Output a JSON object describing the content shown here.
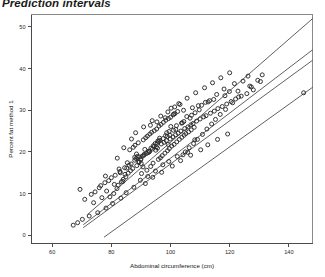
{
  "chart_data": {
    "type": "scatter",
    "title": "Prediction intervals",
    "xlabel": "Abdominal circumference (cm)",
    "ylabel": "Percent fat method 1",
    "xlim": [
      53,
      148
    ],
    "ylim": [
      -2,
      53
    ],
    "xticks": [
      60,
      80,
      100,
      120,
      140
    ],
    "yticks": [
      0,
      10,
      20,
      30,
      40,
      50
    ],
    "grid": false,
    "legend": null,
    "marker": "open-circle",
    "series": [
      {
        "name": "observations",
        "x": [
          69.4,
          78.0,
          86.0,
          88.5,
          82.9,
          83.9,
          88.3,
          95.5,
          104.5,
          98.7,
          99.2,
          101.8,
          89.4,
          95.6,
          98.9,
          100.1,
          91.0,
          90.7,
          94.4,
          89.9,
          99.8,
          96.4,
          105.5,
          103.7,
          97.5,
          95.0,
          92.4,
          90.1,
          84.6,
          85.2,
          88.8,
          92.6,
          96.0,
          99.5,
          102.0,
          106.6,
          108.3,
          110.5,
          112.7,
          115.6,
          118.1,
          121.6,
          126.2,
          124.5,
          119.9,
          113.2,
          109.7,
          107.1,
          104.0,
          101.0,
          98.3,
          94.8,
          91.3,
          87.9,
          85.4,
          82.6,
          80.0,
          77.8,
          75.9,
          73.2,
          71.0,
          74.5,
          76.4,
          79.1,
          81.3,
          83.0,
          84.5,
          86.7,
          87.9,
          89.6,
          91.1,
          92.8,
          93.9,
          95.2,
          96.9,
          97.8,
          98.6,
          99.9,
          100.8,
          101.7,
          102.6,
          103.5,
          104.8,
          105.9,
          106.9,
          107.6,
          108.8,
          110.0,
          111.2,
          112.0,
          113.5,
          114.8,
          116.0,
          117.5,
          119.0,
          120.5,
          122.0,
          123.9,
          125.8,
          128.0,
          90.2,
          92.0,
          93.3,
          94.1,
          95.9,
          96.6,
          97.2,
          98.1,
          99.0,
          99.6,
          100.4,
          101.2,
          102.1,
          103.0,
          103.8,
          104.6,
          105.2,
          106.1,
          107.0,
          108.0,
          86.2,
          87.4,
          88.0,
          89.1,
          90.8,
          91.6,
          92.2,
          93.0,
          93.6,
          94.5,
          95.3,
          96.1,
          96.8,
          97.6,
          98.4,
          99.3,
          100.0,
          100.9,
          101.5,
          102.4,
          79.5,
          80.8,
          81.9,
          82.3,
          83.4,
          84.0,
          84.9,
          85.7,
          86.5,
          87.2,
          88.6,
          89.3,
          90.0,
          90.5,
          91.8,
          92.9,
          93.4,
          94.2,
          95.7,
          96.3,
          104.2,
          105.0,
          106.3,
          107.8,
          109.1,
          110.8,
          112.3,
          113.9,
          115.2,
          116.8,
          118.6,
          121.0,
          123.0,
          127.3,
          129.5,
          131.0,
          74.0,
          76.8,
          78.4,
          81.0,
          100.2,
          102.8,
          105.6,
          108.5,
          111.5,
          114.2,
          117.0,
          120.0,
          88.2,
          90.9,
          93.8,
          96.7,
          99.1,
          101.4,
          103.2,
          86.8,
          84.2,
          82.0,
          145.0,
          108.2,
          91.5,
          94.0,
          97.0,
          100.6,
          103.4,
          106.8,
          110.2,
          112.6,
          115.9,
          119.3,
          87.6,
          85.0,
          83.2,
          80.4,
          78.2,
          75.4,
          72.5,
          70.2,
          68.6,
          67.1,
          93.2,
          95.4,
          98.2,
          101.1,
          104.4,
          107.4,
          109.4,
          111.8,
          114.6,
          118.4,
          122.8,
          126.8,
          130.4,
          89.8,
          92.3,
          94.9,
          97.4,
          99.4,
          102.3,
          105.8
        ],
        "y": [
          11.0,
          14.2,
          16.8,
          19.5,
          15.3,
          12.9,
          18.4,
          22.1,
          27.3,
          24.6,
          21.8,
          25.4,
          17.6,
          20.9,
          23.7,
          26.1,
          19.2,
          16.4,
          21.3,
          18.1,
          24.0,
          22.8,
          28.5,
          26.9,
          23.2,
          20.4,
          19.8,
          17.2,
          14.6,
          16.1,
          18.9,
          20.2,
          22.5,
          24.9,
          26.3,
          28.1,
          29.4,
          31.2,
          32.0,
          33.8,
          35.1,
          36.4,
          38.2,
          37.0,
          34.5,
          32.3,
          30.1,
          28.8,
          27.0,
          25.2,
          23.9,
          22.0,
          20.6,
          18.7,
          17.4,
          15.9,
          13.8,
          12.6,
          11.4,
          9.8,
          8.6,
          10.4,
          11.9,
          13.1,
          14.4,
          15.0,
          16.2,
          17.1,
          18.0,
          18.8,
          19.4,
          20.0,
          20.7,
          21.2,
          21.9,
          22.3,
          22.7,
          23.1,
          23.6,
          24.1,
          24.5,
          25.0,
          25.6,
          26.0,
          26.5,
          26.8,
          27.4,
          27.9,
          28.4,
          28.7,
          29.3,
          29.8,
          30.4,
          30.9,
          31.5,
          32.1,
          32.7,
          33.4,
          34.0,
          34.9,
          14.8,
          15.6,
          16.5,
          17.3,
          18.2,
          18.6,
          19.1,
          19.7,
          20.3,
          20.8,
          21.4,
          21.8,
          22.4,
          23.0,
          23.5,
          24.0,
          24.4,
          24.8,
          25.3,
          25.9,
          20.5,
          21.1,
          21.6,
          22.2,
          22.9,
          23.4,
          23.8,
          24.3,
          24.7,
          25.1,
          25.5,
          26.2,
          26.6,
          27.1,
          27.6,
          28.0,
          28.3,
          28.9,
          29.2,
          29.7,
          9.2,
          10.0,
          11.2,
          12.0,
          12.8,
          13.4,
          14.0,
          14.9,
          15.5,
          16.0,
          16.7,
          17.5,
          18.3,
          19.0,
          19.6,
          20.1,
          20.9,
          21.5,
          22.6,
          23.3,
          19.3,
          20.0,
          21.0,
          22.0,
          23.0,
          24.2,
          25.5,
          26.7,
          27.8,
          29.0,
          30.2,
          31.8,
          33.2,
          35.6,
          37.2,
          38.5,
          7.8,
          9.0,
          10.6,
          12.2,
          30.5,
          31.6,
          32.9,
          34.2,
          35.4,
          36.6,
          37.8,
          39.0,
          24.6,
          26.0,
          27.5,
          28.6,
          29.6,
          30.8,
          31.4,
          23.1,
          21.0,
          18.5,
          34.2,
          22.9,
          12.4,
          13.9,
          15.1,
          16.6,
          17.9,
          19.2,
          20.5,
          21.7,
          23.0,
          24.3,
          11.5,
          10.2,
          8.9,
          7.6,
          6.5,
          5.4,
          4.6,
          3.8,
          3.0,
          2.4,
          26.4,
          27.2,
          28.2,
          29.1,
          30.0,
          30.6,
          31.1,
          31.9,
          32.6,
          33.5,
          34.6,
          35.8,
          36.9,
          13.2,
          14.1,
          15.4,
          16.9,
          17.7,
          18.9,
          19.9
        ]
      }
    ],
    "lines": [
      {
        "name": "upper-prediction-limit",
        "x": [
          72.0,
          148.0
        ],
        "y": [
          5.0,
          52.0
        ]
      },
      {
        "name": "upper-confidence-limit",
        "x": [
          70.5,
          148.0
        ],
        "y": [
          2.5,
          44.5
        ]
      },
      {
        "name": "regression-fit",
        "x": [
          70.5,
          148.0
        ],
        "y": [
          1.8,
          42.0
        ]
      },
      {
        "name": "lower-prediction-limit",
        "x": [
          77.5,
          148.0
        ],
        "y": [
          -0.5,
          35.5
        ]
      }
    ]
  }
}
